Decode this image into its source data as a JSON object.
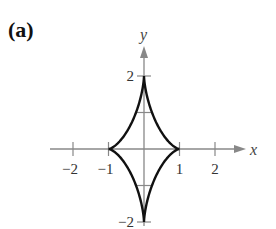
{
  "panel": {
    "label": "(a)"
  },
  "chart_data": {
    "type": "line",
    "title": "",
    "xlabel": "x",
    "ylabel": "y",
    "xlim": [
      -2.6,
      2.6
    ],
    "ylim": [
      -2,
      2.5
    ],
    "grid": false,
    "legend": null,
    "x_ticks": [
      -2,
      -1,
      1,
      2
    ],
    "x_tick_labels": [
      "−2",
      "−1",
      "1",
      "2"
    ],
    "y_ticks": [
      -2,
      -1,
      1,
      2
    ],
    "y_tick_labels": [
      "−2",
      "",
      "",
      "2"
    ],
    "series": [
      {
        "name": "astroid",
        "parametric": "x = cos^3(t), y = 2 sin^3(t), 0 <= t <= 2π",
        "key_points": [
          {
            "x": 1,
            "y": 0
          },
          {
            "x": 0,
            "y": 2
          },
          {
            "x": -1,
            "y": 0
          },
          {
            "x": 0,
            "y": -2
          }
        ],
        "color": "#111111"
      }
    ]
  },
  "colors": {
    "axis": "#888888",
    "curve": "#111111",
    "text": "#333333"
  }
}
